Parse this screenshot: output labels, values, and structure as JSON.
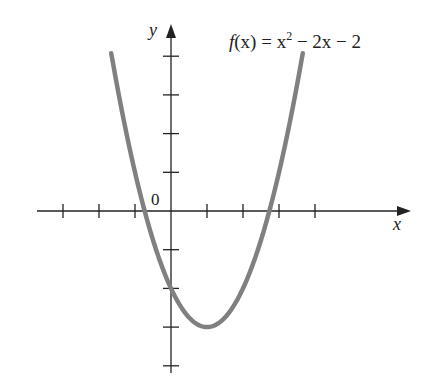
{
  "chart_data": {
    "type": "line",
    "function": "x^2 - 2x - 2",
    "xlabel": "x",
    "ylabel": "y",
    "origin_label": "0",
    "xlim": [
      -3.7,
      6.6
    ],
    "ylim": [
      -4.2,
      4.8
    ],
    "x_ticks": [
      -3,
      -2,
      -1,
      1,
      2,
      3,
      4
    ],
    "y_ticks": [
      -4,
      -3,
      -2,
      -1,
      1,
      2,
      3,
      4
    ],
    "tick_labels_shown": false,
    "grid": false,
    "legend": null,
    "series": [
      {
        "name": "f(x) = x^2 - 2x - 2",
        "color": "#808080",
        "x": [
          -1.66,
          -1,
          0,
          1,
          2,
          3,
          3.66
        ],
        "y": [
          4.08,
          1,
          -2,
          -3,
          -2,
          1,
          3.9
        ]
      }
    ],
    "annotations": [
      {
        "text": "f(x) = x² − 2x − 2",
        "position": "top-right"
      }
    ],
    "key_points": {
      "vertex": [
        1,
        -3
      ],
      "y_intercept": [
        0,
        -2
      ],
      "x_intercepts": [
        -0.73,
        2.73
      ]
    }
  },
  "labels": {
    "func_f": "f",
    "func_rest": "(x) = x",
    "func_exp": "2",
    "func_tail": " − 2x − 2",
    "x_axis": "x",
    "y_axis": "y",
    "origin": "0"
  },
  "colors": {
    "axis": "#222222",
    "curve": "#808080"
  }
}
